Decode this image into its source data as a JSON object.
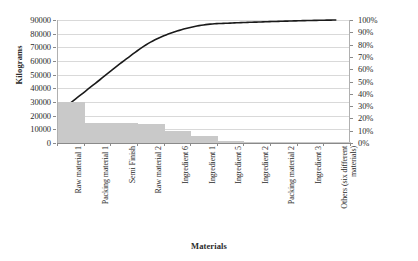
{
  "chart_data": {
    "type": "bar",
    "chart_style": "pareto",
    "title": "",
    "xlabel": "Materials",
    "ylabel": "Kilograms",
    "y2label": "",
    "ylim": [
      0,
      90000
    ],
    "y2lim": [
      0,
      100
    ],
    "grid": true,
    "legend": "none",
    "categories": [
      "Raw material 1",
      "Packing material 1",
      "Semi Finish",
      "Raw material 2",
      "Ingredient 6",
      "Ingredient 1",
      "Ingredient 5",
      "Ingredient 2",
      "Packing material 2",
      "Ingredient 3",
      "Others (six different materials)"
    ],
    "series": [
      {
        "name": "Kilograms",
        "type": "bar",
        "axis": "left",
        "color": "#c9c9c9",
        "values": [
          30000,
          15000,
          15000,
          14000,
          8500,
          5000,
          1500,
          300,
          200,
          150,
          100
        ]
      },
      {
        "name": "Cumulative percentage",
        "type": "line",
        "axis": "right",
        "color": "#1a1a1a",
        "values": [
          33,
          50,
          67,
          82,
          91,
          96,
          97.5,
          98.3,
          99.0,
          99.6,
          100
        ]
      }
    ],
    "yticks": [
      "0",
      "10000",
      "20000",
      "30000",
      "40000",
      "50000",
      "60000",
      "70000",
      "80000",
      "90000"
    ],
    "ytick_values": [
      0,
      10000,
      20000,
      30000,
      40000,
      50000,
      60000,
      70000,
      80000,
      90000
    ],
    "y2ticks": [
      "0%",
      "10%",
      "20%",
      "30%",
      "40%",
      "50%",
      "60%",
      "70%",
      "80%",
      "90%",
      "100%"
    ],
    "y2tick_values": [
      0,
      10,
      20,
      30,
      40,
      50,
      60,
      70,
      80,
      90,
      100
    ]
  }
}
